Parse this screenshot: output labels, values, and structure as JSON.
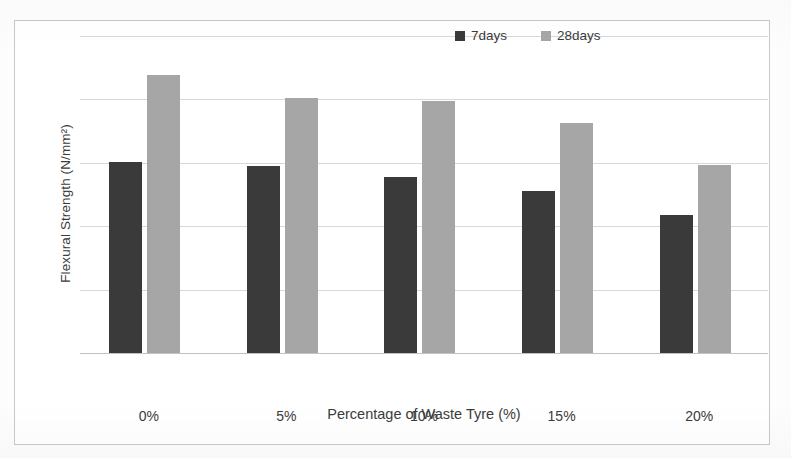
{
  "chart_data": {
    "type": "bar",
    "title": "",
    "subtitle": "",
    "xlabel": "Percentage of Waste Tyre (%)",
    "ylabel": "Flexural Strength (N/mm²)",
    "categories": [
      "0%",
      "5%",
      "10%",
      "15%",
      "20%"
    ],
    "series": [
      {
        "name": "7days",
        "color": "#3a3a3a",
        "values": [
          3.02,
          2.95,
          2.78,
          2.55,
          2.17
        ]
      },
      {
        "name": "28days",
        "color": "#a6a6a6",
        "values": [
          4.38,
          4.02,
          3.97,
          3.63,
          2.97
        ]
      }
    ],
    "ylim": [
      0,
      5
    ],
    "ytick_step": 1,
    "ytick_labels": [
      "0",
      "1",
      "2",
      "3",
      "4",
      "5"
    ],
    "grid": true,
    "grid_axis": "y",
    "legend_position": "top-right",
    "annotations": []
  },
  "legend": {
    "entries": [
      {
        "label": "7days"
      },
      {
        "label": "28days"
      }
    ]
  },
  "colors": {
    "series_7days": "#3a3a3a",
    "series_28days": "#a6a6a6",
    "gridline": "#d8d8d8",
    "axis_text": "#3b3b3b",
    "figure_border": "#c9c9c9",
    "background": "#ffffff"
  }
}
